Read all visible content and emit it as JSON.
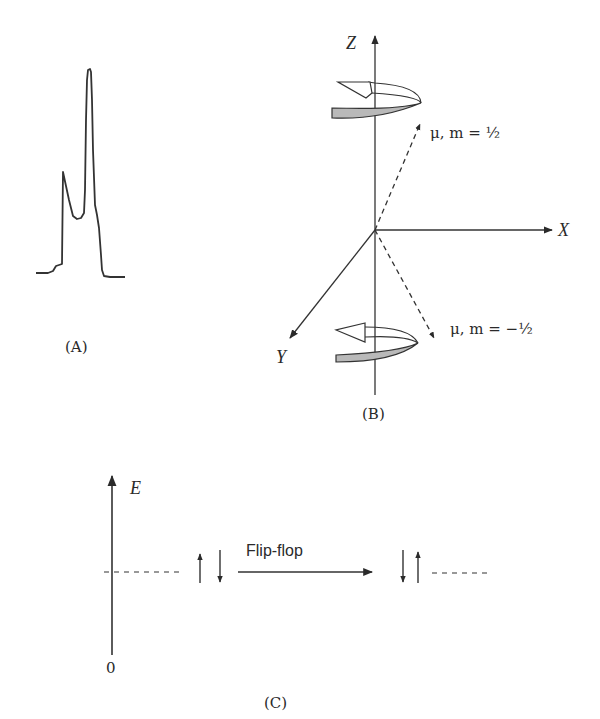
{
  "panels": {
    "A": {
      "label": "(A)",
      "description": "NMR spectrum trace with a small left peak and a tall right peak"
    },
    "B": {
      "label": "(B)",
      "axes": {
        "z": "Z",
        "x": "X",
        "y": "Y"
      },
      "upper_vector_label": "μ, m = ½",
      "lower_vector_label": "μ, m = −½",
      "upper_rotation_icon": "precession-arrow-icon",
      "lower_rotation_icon": "precession-arrow-icon"
    },
    "C": {
      "label": "(C)",
      "energy_axis_label": "E",
      "origin_label": "0",
      "transition_label": "Flip-flop",
      "initial_state": "↑↓",
      "final_state": "↓↑"
    }
  },
  "colors": {
    "ink": "#2a2a2a",
    "ribbon_fill": "#b9b9b9"
  }
}
